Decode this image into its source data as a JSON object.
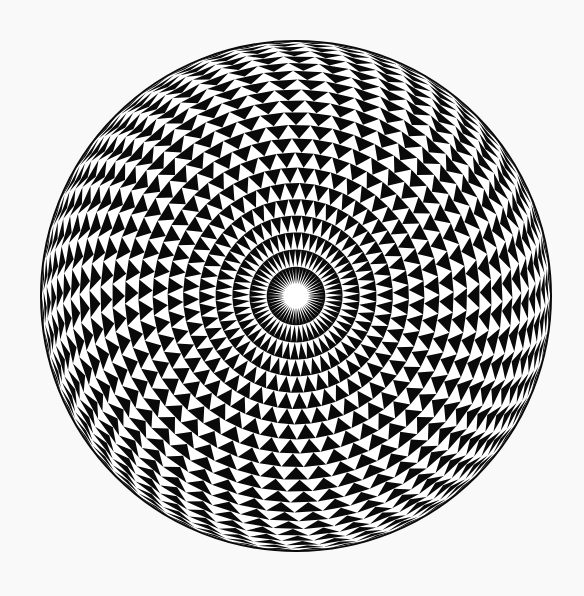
{
  "image": {
    "subject": "Black and white torus rosette of alternating triangles forming a spherical optical illusion",
    "background_color": "#f9f9f9",
    "ink_color": "#0a0a0a",
    "paper_color": "#ffffff",
    "center": [
      296,
      296
    ],
    "radius": 255,
    "center_hole_radius": 12,
    "rings": 22,
    "segments": 48
  }
}
